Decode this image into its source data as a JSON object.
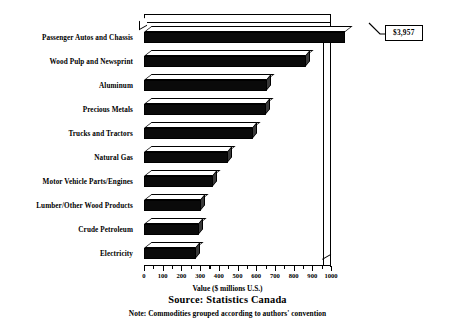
{
  "chart_data": {
    "type": "bar",
    "orientation": "horizontal",
    "title": "",
    "xlabel": "Value ($ millions U.S.)",
    "ylabel": "",
    "xlim": [
      0,
      1000
    ],
    "grid": false,
    "legend": null,
    "axis_ticks": [
      0,
      100,
      200,
      300,
      400,
      500,
      600,
      700,
      800,
      900,
      1000
    ],
    "minor_ticks_between": 1,
    "categories": [
      "Passenger Autos and Chassis",
      "Wood Pulp and Newsprint",
      "Aluminum",
      "Precious Metals",
      "Trucks and Tractors",
      "Natural Gas",
      "Motor Vehicle Parts/Engines",
      "Lumber/Other Wood Products",
      "Crude Petroleum",
      "Electricity"
    ],
    "values": [
      3957,
      865,
      660,
      650,
      585,
      450,
      370,
      305,
      295,
      280
    ],
    "clipped_bars": [
      {
        "category": "Passenger Autos and Chassis",
        "value": 3957,
        "display_label": "$3,957",
        "note": "bar extends beyond axis maximum; value shown in callout box"
      }
    ],
    "annotations": [
      {
        "name": "value-callout",
        "text": "$3,957",
        "target_category": "Passenger Autos and Chassis"
      }
    ],
    "source": "Source: Statistics Canada",
    "note": "Note: Commodities grouped according to authors' convention"
  },
  "axis": {
    "title": "Value ($ millions U.S.)",
    "tick_labels": [
      "0",
      "100",
      "200",
      "300",
      "400",
      "500",
      "600",
      "700",
      "800",
      "900",
      "1000"
    ]
  },
  "callout": {
    "value_label": "$3,957"
  },
  "captions": {
    "source": "Source: Statistics Canada",
    "note": "Note: Commodities grouped according to authors' convention"
  },
  "colors": {
    "bar_front": "#0a0a0a",
    "bar_top": "#ffffff",
    "bar_cap": "#3a3a3a",
    "outline": "#000000",
    "background": "#ffffff"
  }
}
